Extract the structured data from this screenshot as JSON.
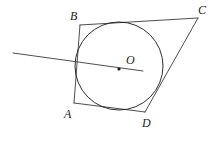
{
  "figure": {
    "width": 219,
    "height": 141,
    "background_color": "#ffffff",
    "stroke_color": "#3a3a3a",
    "circle_stroke_color": "#222222",
    "label_color": "#232323",
    "stroke_width": 0.9
  },
  "circle": {
    "name": "inscribed-circle",
    "center_label": "O",
    "cx": 119,
    "cy": 66,
    "r": 44
  },
  "center_point": {
    "name": "center-dot",
    "cx": 119,
    "cy": 69,
    "r": 1.6
  },
  "vertices": [
    {
      "id": "B",
      "label": "B",
      "x": 80,
      "y": 25,
      "label_x": 70,
      "label_y": 10
    },
    {
      "id": "C",
      "label": "C",
      "x": 198,
      "y": 18,
      "label_x": 198,
      "label_y": 4
    },
    {
      "id": "D",
      "label": "D",
      "x": 145,
      "y": 112,
      "label_x": 142,
      "label_y": 117
    },
    {
      "id": "A",
      "label": "A",
      "x": 74,
      "y": 103,
      "label_x": 64,
      "label_y": 108
    }
  ],
  "sides": [
    {
      "name": "side-BC",
      "from": "B",
      "to": "C",
      "x1": 80,
      "y1": 25,
      "x2": 198,
      "y2": 18
    },
    {
      "name": "side-CD",
      "from": "C",
      "to": "D",
      "x1": 198,
      "y1": 18,
      "x2": 145,
      "y2": 112
    },
    {
      "name": "side-DA",
      "from": "D",
      "to": "A",
      "x1": 145,
      "y1": 112,
      "x2": 74,
      "y2": 103
    },
    {
      "name": "side-AB",
      "from": "A",
      "to": "B",
      "x1": 74,
      "y1": 103,
      "x2": 80,
      "y2": 25
    }
  ],
  "secant_line": {
    "name": "secant-through-center",
    "x1": 13,
    "y1": 53,
    "x2": 143,
    "y2": 71
  }
}
